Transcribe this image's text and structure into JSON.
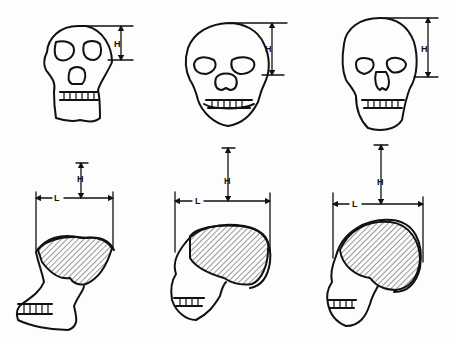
{
  "diagram": {
    "type": "comparative anatomical line drawing",
    "layout": "3 columns x 2 rows (frontal view top, lateral view bottom)",
    "colors": {
      "ink": "#111111",
      "background": "#fdfdfd",
      "hatch": "#333333"
    },
    "measure_labels": {
      "height": "H",
      "length": "L"
    },
    "columns": [
      {
        "id": "skull-1",
        "front": {
          "label": "H"
        },
        "side": {
          "height_label": "H",
          "length_label": "L"
        }
      },
      {
        "id": "skull-2",
        "front": {
          "label": "H"
        },
        "side": {
          "height_label": "H",
          "length_label": "L"
        }
      },
      {
        "id": "skull-3",
        "front": {
          "label": "H"
        },
        "side": {
          "height_label": "H",
          "length_label": "L"
        }
      }
    ]
  }
}
